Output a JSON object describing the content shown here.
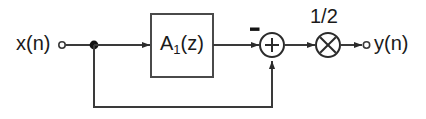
{
  "diagram": {
    "background_color": "#ffffff",
    "line_color": "#3a3a3a",
    "text_color": "#1a1a1a",
    "input": {
      "label": "x(n)",
      "terminal": "open-circle",
      "terminal_x": 62,
      "terminal_y": 45
    },
    "output": {
      "label": "y(n)",
      "terminal": "open-circle",
      "terminal_x": 366,
      "terminal_y": 45
    },
    "block": {
      "label_main": "A",
      "label_sub": "1",
      "label_tail": "(z)",
      "label_full": "A1(z)",
      "x": 151,
      "y": 14,
      "width": 62,
      "height": 63
    },
    "summer": {
      "symbol": "+",
      "sign_top_input": "−",
      "sign_bottom_input": "+",
      "center_x": 272,
      "center_y": 45,
      "radius": 12
    },
    "multiplier": {
      "symbol": "×",
      "gain_label": "1/2",
      "center_x": 328,
      "center_y": 45,
      "radius": 12
    },
    "junction": {
      "label": "branch-node",
      "x": 94,
      "y": 45
    },
    "feedback_path": {
      "from_x": 94,
      "bottom_y": 107,
      "to_x": 272
    },
    "signal_line_y": 45
  }
}
